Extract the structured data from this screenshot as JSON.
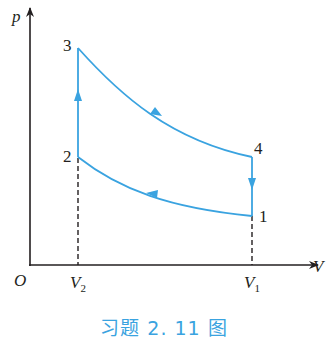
{
  "diagram": {
    "type": "p-V cycle diagram",
    "axes": {
      "y_label": "p",
      "x_label": "V",
      "origin_label": "O"
    },
    "ticks": {
      "v2": {
        "main": "V",
        "sub": "2"
      },
      "v1": {
        "main": "V",
        "sub": "1"
      }
    },
    "points": [
      {
        "id": "1",
        "label": "1"
      },
      {
        "id": "2",
        "label": "2"
      },
      {
        "id": "3",
        "label": "3"
      },
      {
        "id": "4",
        "label": "4"
      }
    ],
    "process_order": [
      "1→2",
      "2→3",
      "3→4",
      "4→1"
    ],
    "colors": {
      "curve": "#3aa3e0",
      "axis": "#231f20",
      "caption": "#3aa3e0"
    }
  },
  "caption": "习题 2. 11 图"
}
